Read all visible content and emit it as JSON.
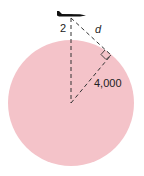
{
  "diagram": {
    "labels": {
      "altitude": "2",
      "line_of_sight": "d",
      "radius": "4,000"
    },
    "colors": {
      "planet_fill": "#f4c3c9",
      "line": "#333333",
      "plane": "#111111"
    }
  }
}
